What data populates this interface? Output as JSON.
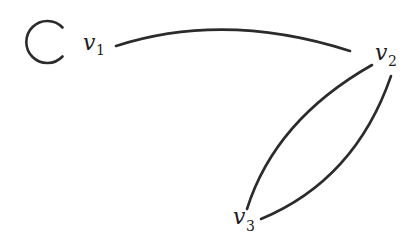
{
  "diagram": {
    "type": "graph",
    "directed": false,
    "vertices": [
      {
        "id": "v1",
        "label_main": "v",
        "label_sub": "1"
      },
      {
        "id": "v2",
        "label_main": "v",
        "label_sub": "2"
      },
      {
        "id": "v3",
        "label_main": "v",
        "label_sub": "3"
      }
    ],
    "edges": [
      {
        "from": "v1",
        "to": "v1",
        "kind": "loop"
      },
      {
        "from": "v1",
        "to": "v2",
        "kind": "curve"
      },
      {
        "from": "v2",
        "to": "v3",
        "kind": "curve"
      },
      {
        "from": "v2",
        "to": "v3",
        "kind": "curve"
      }
    ],
    "colors": {
      "stroke": "#2b2b2b",
      "background": "#ffffff"
    }
  }
}
